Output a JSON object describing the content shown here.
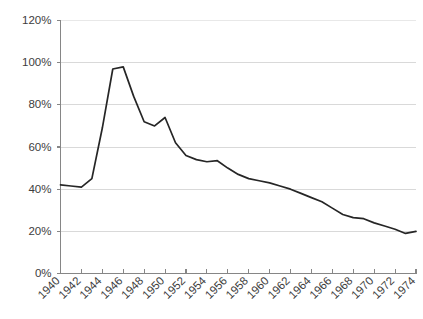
{
  "chart_data": {
    "type": "line",
    "title": "",
    "subtitle": "",
    "xlabel": "",
    "ylabel": "",
    "xlim": [
      1940,
      1974
    ],
    "ylim": [
      0,
      120
    ],
    "grid": true,
    "legend": false,
    "legend_position": "none",
    "line_color": "#262626",
    "gridline_color": "#d9d9d9",
    "axis_color": "#868686",
    "y_ticks": [
      0,
      20,
      40,
      60,
      80,
      100,
      120
    ],
    "y_tick_labels": [
      "0%",
      "20%",
      "40%",
      "60%",
      "80%",
      "100%",
      "120%"
    ],
    "x_ticks": [
      1940,
      1942,
      1944,
      1946,
      1948,
      1950,
      1952,
      1954,
      1956,
      1958,
      1960,
      1962,
      1964,
      1966,
      1968,
      1970,
      1972,
      1974
    ],
    "x_tick_labels": [
      "1940",
      "1942",
      "1944",
      "1946",
      "1948",
      "1950",
      "1952",
      "1954",
      "1956",
      "1958",
      "1960",
      "1962",
      "1964",
      "1966",
      "1968",
      "1970",
      "1972",
      "1974"
    ],
    "x": [
      1940,
      1941,
      1942,
      1943,
      1944,
      1945,
      1946,
      1947,
      1948,
      1949,
      1950,
      1951,
      1952,
      1953,
      1954,
      1955,
      1956,
      1957,
      1958,
      1959,
      1960,
      1961,
      1962,
      1963,
      1964,
      1965,
      1966,
      1967,
      1968,
      1969,
      1970,
      1971,
      1972,
      1973,
      1974
    ],
    "values": [
      42,
      41.5,
      41,
      45,
      69,
      97,
      98,
      84,
      72,
      70,
      74,
      62,
      56,
      54,
      53,
      53.5,
      50,
      47,
      45,
      44,
      43,
      41.5,
      40,
      38,
      36,
      34,
      31,
      28,
      26.5,
      26,
      24,
      22.5,
      21,
      19,
      20
    ],
    "series": [
      {
        "name": "",
        "values": [
          42,
          41.5,
          41,
          45,
          69,
          97,
          98,
          84,
          72,
          70,
          74,
          62,
          56,
          54,
          53,
          53.5,
          50,
          47,
          45,
          44,
          43,
          41.5,
          40,
          38,
          36,
          34,
          31,
          28,
          26.5,
          26,
          24,
          22.5,
          21,
          19,
          20
        ]
      }
    ]
  }
}
